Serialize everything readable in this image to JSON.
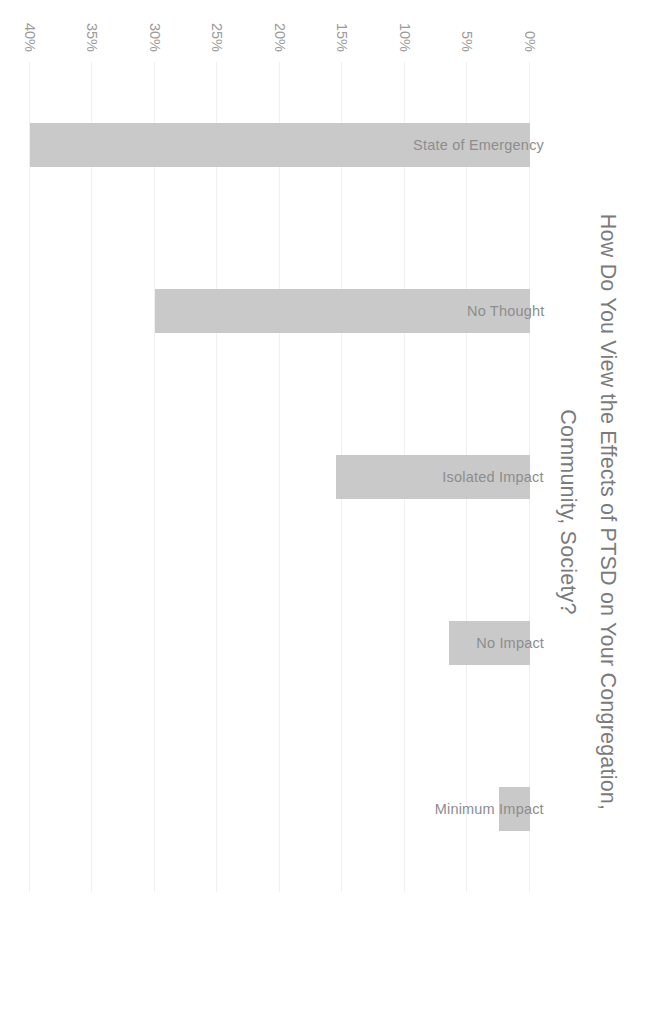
{
  "chart_data": {
    "type": "bar",
    "orientation": "vertical",
    "title": "How Do You View the Effects of PTSD on Your Congregation,\nCommunity, Society?",
    "xlabel": "",
    "ylabel": "",
    "categories": [
      "State of Emergency",
      "No Thought",
      "Isolated Impact",
      "No Impact",
      "Minimum Impact"
    ],
    "values": [
      40,
      30,
      15.5,
      6.5,
      2.5
    ],
    "value_labels": [
      "40%",
      "30%",
      "15.5%",
      "6.5%",
      "2.5%"
    ],
    "ylim": [
      0,
      40
    ],
    "ytick_labels": [
      "0%",
      "5%",
      "10%",
      "15%",
      "20%",
      "25%",
      "30%",
      "35%",
      "40%"
    ],
    "ytick_values": [
      0,
      5,
      10,
      15,
      20,
      25,
      30,
      35,
      40
    ],
    "grid": true,
    "legend": false,
    "bar_color": "#c9c9c9",
    "title_color": "#7b7b7b",
    "tick_color": "#9a9a9a",
    "label_color": "#8d8d8d",
    "background_color": "#ffffff",
    "page_rotation_degrees": 90
  }
}
